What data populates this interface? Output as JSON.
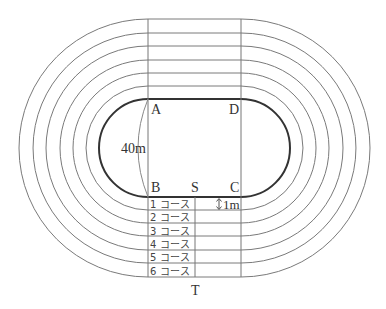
{
  "diagram": {
    "title": "",
    "points": {
      "A": "A",
      "B": "B",
      "C": "C",
      "D": "D",
      "S": "S",
      "T": "T"
    },
    "dimensions": {
      "width_label": "40m",
      "lane_width_label": "1m"
    },
    "lanes": [
      {
        "label": "1 コース"
      },
      {
        "label": "2 コース"
      },
      {
        "label": "3 コース"
      },
      {
        "label": "4 コース"
      },
      {
        "label": "5 コース"
      },
      {
        "label": "6 コース"
      }
    ],
    "colors": {
      "inner_track": "#333333",
      "lane_lines": "#777777",
      "background": "#ffffff"
    }
  }
}
